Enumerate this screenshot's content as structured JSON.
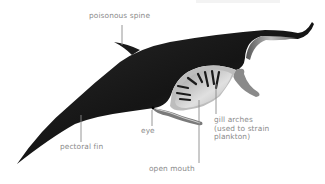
{
  "diagram": {
    "colors": {
      "body_dark": "#1a1a1a",
      "body_mid": "#3a3a3a",
      "underside_light": "#c8c8c8",
      "mouth_inner": "#d9d9d9",
      "label_text": "#8a8a8a",
      "leader_line": "#8a8a8a"
    },
    "labels": [
      {
        "id": "poisonous-spine",
        "text": "poisonous spine"
      },
      {
        "id": "pectoral-fin",
        "text": "pectoral fin"
      },
      {
        "id": "eye",
        "text": "eye"
      },
      {
        "id": "open-mouth",
        "text": "open mouth"
      },
      {
        "id": "gill-arches",
        "lines": [
          "gill arches",
          "(used to strain",
          "plankton)"
        ]
      }
    ]
  }
}
